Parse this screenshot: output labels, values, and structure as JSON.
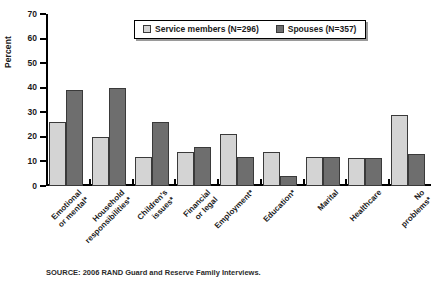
{
  "chart_data": {
    "type": "bar",
    "title": "",
    "xlabel": "",
    "ylabel": "Percent",
    "ylim": [
      0,
      70
    ],
    "ytick_labels": [
      "0",
      "10",
      "20",
      "30",
      "40",
      "50",
      "60",
      "70"
    ],
    "ytick_values": [
      0,
      10,
      20,
      30,
      40,
      50,
      60,
      70
    ],
    "grid": false,
    "legend_position": "top-center",
    "categories": [
      "Emotional or mental*",
      "Household responsibilities*",
      "Children's issues*",
      "Financial or legal",
      "Employment*",
      "Education*",
      "Marital",
      "Healthcare",
      "No problems*"
    ],
    "series": [
      {
        "name": "Service members (N=296)",
        "color": "#d4d4d4",
        "values": [
          26,
          20,
          12,
          14,
          21,
          14,
          12,
          11.5,
          29
        ]
      },
      {
        "name": "Spouses (N=357)",
        "color": "#6e6e6e",
        "values": [
          39,
          40,
          26,
          16,
          12,
          4,
          12,
          11.5,
          13
        ]
      }
    ]
  },
  "legend": {
    "entries": [
      {
        "label": "Service members (N=296)",
        "swatch": "#d4d4d4"
      },
      {
        "label": "Spouses (N=357)",
        "swatch": "#6e6e6e"
      }
    ]
  },
  "axis": {
    "y_title": "Percent"
  },
  "source": {
    "text": "SOURCE: 2006 RAND Guard and Reserve Family Interviews."
  }
}
